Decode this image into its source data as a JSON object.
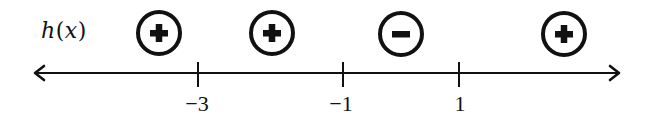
{
  "diagram": {
    "function_label": {
      "name": "h",
      "open_paren": "(",
      "variable": "x",
      "close_paren": ")"
    },
    "axis": {
      "color": "#111111",
      "left_arrow": true,
      "right_arrow": true
    },
    "ticks": [
      {
        "value": -3,
        "label": "−3",
        "x": 198
      },
      {
        "value": -1,
        "label": "−1",
        "x": 343
      },
      {
        "value": 1,
        "label": "1",
        "x": 459
      }
    ],
    "intervals": [
      {
        "range": "x < -3",
        "sign": "positive",
        "symbol": "+",
        "icon": "plus-circle-icon",
        "cx": 159
      },
      {
        "range": "-3 < x < -1",
        "sign": "positive",
        "symbol": "+",
        "icon": "plus-circle-icon",
        "cx": 272
      },
      {
        "range": "-1 < x < 1",
        "sign": "negative",
        "symbol": "−",
        "icon": "minus-circle-icon",
        "cx": 401
      },
      {
        "range": "x > 1",
        "sign": "positive",
        "symbol": "+",
        "icon": "plus-circle-icon",
        "cx": 564
      }
    ]
  }
}
